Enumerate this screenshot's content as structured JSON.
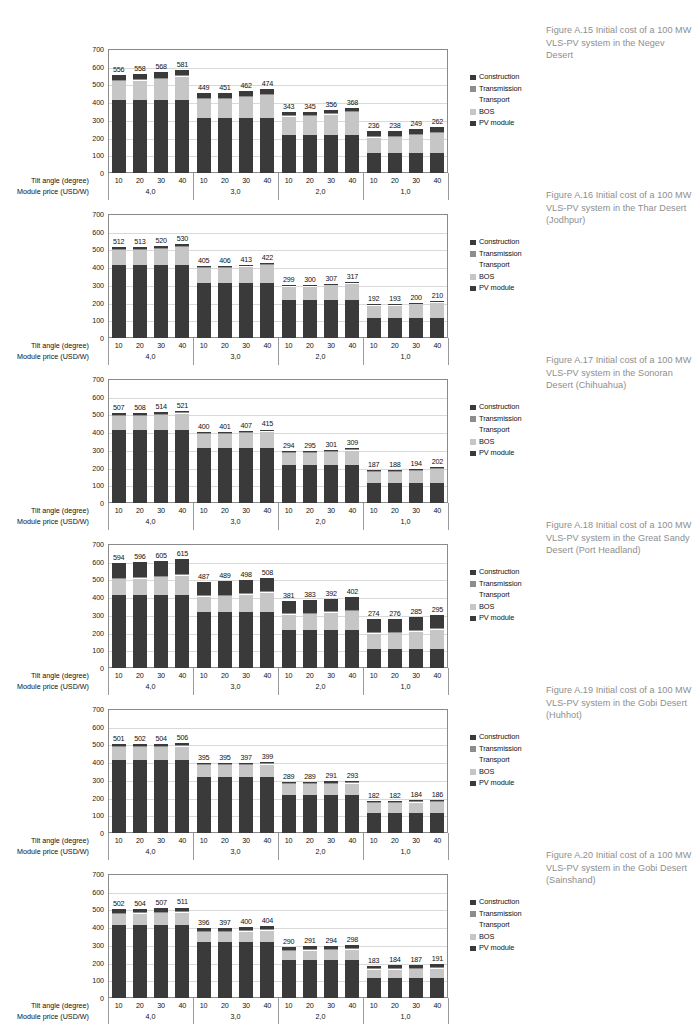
{
  "axis": {
    "y_ticks": [
      700,
      600,
      500,
      400,
      300,
      200,
      100,
      0
    ],
    "y_min": 0,
    "y_max": 700,
    "tilt_row_label": "Tilt angle (degree)",
    "price_row_label": "Module price (USD/W)",
    "tilt_angles": [
      "10",
      "20",
      "30",
      "40",
      "10",
      "20",
      "30",
      "40",
      "10",
      "20",
      "30",
      "40",
      "10",
      "20",
      "30",
      "40"
    ],
    "module_prices": [
      "4,0",
      "3,0",
      "2,0",
      "1,0"
    ]
  },
  "legend": {
    "items": [
      {
        "label": "Construction",
        "color": "#3a3a3a",
        "swatch": true
      },
      {
        "label": "Transmission",
        "color": "#8d8d8d",
        "swatch": true
      },
      {
        "label": "Transport",
        "color": "#ffffff",
        "swatch": false
      },
      {
        "label": "BOS",
        "color": "#c6c6c6",
        "swatch": true
      },
      {
        "label": "PV module",
        "color": "#3a3a3a",
        "swatch": true
      }
    ]
  },
  "colors": {
    "pv_module": "#3a3a3a",
    "bos": "#c6c6c6",
    "transport": "#fdfdfd",
    "transmission": "#8d8d8d",
    "construction": "#3a3a3a",
    "plot_border": "#8a8a8a",
    "gridline": "#d9d9d9",
    "caption_text": "#8e8e8e"
  },
  "chart_data": [
    {
      "type": "bar",
      "id": "fig-a15",
      "title": "Figure A.15 Initial cost of a 100 MW VLS-PV system in the Negev Desert",
      "caption": "Figure A.15 Initial cost of a 100 MW VLS-PV system in the Negev Desert",
      "xlabel": "Tilt angle (degree) / Module price (USD/W)",
      "ylabel": "",
      "ylim": [
        0,
        700
      ],
      "grid": true,
      "legend_position": "right",
      "stacked": true,
      "categories": [
        "10",
        "20",
        "30",
        "40",
        "10",
        "20",
        "30",
        "40",
        "10",
        "20",
        "30",
        "40",
        "10",
        "20",
        "30",
        "40"
      ],
      "groups": [
        "4,0",
        "3,0",
        "2,0",
        "1,0"
      ],
      "totals": [
        556,
        558,
        568,
        581,
        449,
        451,
        462,
        474,
        343,
        345,
        356,
        368,
        236,
        238,
        249,
        262
      ],
      "series": [
        {
          "name": "PV module",
          "values": [
            413,
            413,
            413,
            413,
            310,
            310,
            310,
            310,
            212,
            212,
            212,
            212,
            114,
            114,
            114,
            114
          ]
        },
        {
          "name": "BOS",
          "values": [
            107,
            109,
            119,
            132,
            107,
            109,
            120,
            132,
            107,
            109,
            120,
            132,
            88,
            90,
            101,
            114
          ]
        },
        {
          "name": "Transport",
          "values": [
            4,
            4,
            4,
            4,
            4,
            4,
            4,
            4,
            4,
            4,
            4,
            4,
            4,
            4,
            4,
            4
          ]
        },
        {
          "name": "Transmission",
          "values": [
            2,
            2,
            2,
            2,
            2,
            2,
            2,
            2,
            2,
            2,
            2,
            2,
            2,
            2,
            2,
            2
          ]
        },
        {
          "name": "Construction",
          "values": [
            30,
            30,
            30,
            30,
            26,
            26,
            26,
            26,
            18,
            18,
            18,
            18,
            28,
            28,
            28,
            28
          ]
        }
      ]
    },
    {
      "type": "bar",
      "id": "fig-a16",
      "title": "Figure A.16 Initial cost of a 100 MW VLS-PV system in the Thar Desert (Jodhpur)",
      "caption": "Figure A.16 Initial cost of a 100 MW VLS-PV system in the Thar Desert (Jodhpur)",
      "ylim": [
        0,
        700
      ],
      "grid": true,
      "legend_position": "right",
      "stacked": true,
      "categories": [
        "10",
        "20",
        "30",
        "40",
        "10",
        "20",
        "30",
        "40",
        "10",
        "20",
        "30",
        "40",
        "10",
        "20",
        "30",
        "40"
      ],
      "groups": [
        "4,0",
        "3,0",
        "2,0",
        "1,0"
      ],
      "totals": [
        512,
        513,
        520,
        530,
        405,
        406,
        413,
        422,
        299,
        300,
        307,
        317,
        192,
        193,
        200,
        210
      ],
      "series": [
        {
          "name": "PV module",
          "values": [
            411,
            411,
            411,
            411,
            313,
            313,
            313,
            313,
            212,
            212,
            212,
            212,
            113,
            113,
            113,
            113
          ]
        },
        {
          "name": "BOS",
          "values": [
            84,
            85,
            92,
            102,
            84,
            85,
            92,
            101,
            80,
            81,
            88,
            98,
            72,
            73,
            80,
            90
          ]
        },
        {
          "name": "Transport",
          "values": [
            5,
            5,
            5,
            5,
            3,
            3,
            3,
            3,
            3,
            3,
            3,
            3,
            3,
            3,
            3,
            3
          ]
        },
        {
          "name": "Transmission",
          "values": [
            2,
            2,
            2,
            2,
            2,
            2,
            2,
            2,
            2,
            2,
            2,
            2,
            2,
            2,
            2,
            2
          ]
        },
        {
          "name": "Construction",
          "values": [
            10,
            10,
            10,
            10,
            3,
            3,
            3,
            3,
            2,
            2,
            2,
            2,
            2,
            2,
            2,
            2
          ]
        }
      ]
    },
    {
      "type": "bar",
      "id": "fig-a17",
      "title": "Figure A.17 Initial cost of a 100 MW VLS-PV system in the Sonoran Desert (Chihuahua)",
      "caption": "Figure A.17 Initial cost of a 100 MW VLS-PV system in the Sonoran Desert (Chihuahua)",
      "ylim": [
        0,
        700
      ],
      "grid": true,
      "legend_position": "right",
      "stacked": true,
      "categories": [
        "10",
        "20",
        "30",
        "40",
        "10",
        "20",
        "30",
        "40",
        "10",
        "20",
        "30",
        "40",
        "10",
        "20",
        "30",
        "40"
      ],
      "groups": [
        "4,0",
        "3,0",
        "2,0",
        "1,0"
      ],
      "totals": [
        507,
        508,
        514,
        521,
        400,
        401,
        407,
        415,
        294,
        295,
        301,
        309,
        187,
        188,
        194,
        202
      ],
      "series": [
        {
          "name": "PV module",
          "values": [
            411,
            411,
            411,
            411,
            312,
            312,
            312,
            312,
            212,
            212,
            212,
            212,
            113,
            113,
            113,
            113
          ]
        },
        {
          "name": "BOS",
          "values": [
            81,
            82,
            88,
            95,
            78,
            79,
            85,
            93,
            72,
            73,
            79,
            87,
            64,
            65,
            71,
            79
          ]
        },
        {
          "name": "Transport",
          "values": [
            4,
            4,
            4,
            4,
            3,
            3,
            3,
            3,
            3,
            3,
            3,
            3,
            3,
            3,
            3,
            3
          ]
        },
        {
          "name": "Transmission",
          "values": [
            2,
            2,
            2,
            2,
            2,
            2,
            2,
            2,
            2,
            2,
            2,
            2,
            2,
            2,
            2,
            2
          ]
        },
        {
          "name": "Construction",
          "values": [
            9,
            9,
            9,
            9,
            5,
            5,
            5,
            5,
            5,
            5,
            5,
            5,
            5,
            5,
            5,
            5
          ]
        }
      ]
    },
    {
      "type": "bar",
      "id": "fig-a18",
      "title": "Figure A.18 Initial cost of a 100 MW VLS-PV system in the Great Sandy Desert (Port Headland)",
      "caption": "Figure A.18 Initial cost of a 100 MW VLS-PV system in the Great Sandy Desert (Port Headland)",
      "ylim": [
        0,
        700
      ],
      "grid": true,
      "legend_position": "right",
      "stacked": true,
      "categories": [
        "10",
        "20",
        "30",
        "40",
        "10",
        "20",
        "30",
        "40",
        "10",
        "20",
        "30",
        "40",
        "10",
        "20",
        "30",
        "40"
      ],
      "groups": [
        "4,0",
        "3,0",
        "2,0",
        "1,0"
      ],
      "totals": [
        594,
        596,
        605,
        615,
        487,
        489,
        498,
        508,
        381,
        383,
        392,
        402,
        274,
        276,
        285,
        295
      ],
      "series": [
        {
          "name": "PV module",
          "values": [
            415,
            415,
            415,
            415,
            317,
            317,
            317,
            317,
            215,
            215,
            215,
            215,
            109,
            109,
            109,
            109
          ]
        },
        {
          "name": "BOS",
          "values": [
            87,
            89,
            98,
            108,
            87,
            89,
            98,
            108,
            87,
            89,
            98,
            108,
            87,
            89,
            98,
            108
          ]
        },
        {
          "name": "Transport",
          "values": [
            4,
            4,
            4,
            4,
            4,
            4,
            4,
            4,
            4,
            4,
            4,
            4,
            4,
            4,
            4,
            4
          ]
        },
        {
          "name": "Transmission",
          "values": [
            3,
            3,
            3,
            3,
            3,
            3,
            3,
            3,
            3,
            3,
            3,
            3,
            3,
            3,
            3,
            3
          ]
        },
        {
          "name": "Construction",
          "values": [
            85,
            85,
            85,
            85,
            76,
            76,
            76,
            76,
            72,
            72,
            72,
            72,
            74,
            74,
            74,
            74
          ]
        }
      ]
    },
    {
      "type": "bar",
      "id": "fig-a19",
      "title": "Figure A.19 Initial cost of a 100 MW VLS-PV system in the Gobi Desert (Huhhot)",
      "caption": "Figure A.19 Initial cost of a 100 MW VLS-PV system in the Gobi Desert (Huhhot)",
      "ylim": [
        0,
        700
      ],
      "grid": true,
      "legend_position": "right",
      "stacked": true,
      "categories": [
        "10",
        "20",
        "30",
        "40",
        "10",
        "20",
        "30",
        "40",
        "10",
        "20",
        "30",
        "40",
        "10",
        "20",
        "30",
        "40"
      ],
      "groups": [
        "4,0",
        "3,0",
        "2,0",
        "1,0"
      ],
      "totals": [
        501,
        502,
        504,
        506,
        395,
        395,
        397,
        399,
        289,
        289,
        291,
        293,
        182,
        182,
        184,
        186
      ],
      "series": [
        {
          "name": "PV module",
          "values": [
            414,
            414,
            414,
            414,
            314,
            314,
            314,
            314,
            213,
            213,
            213,
            213,
            112,
            112,
            112,
            112
          ]
        },
        {
          "name": "BOS",
          "values": [
            71,
            72,
            74,
            76,
            70,
            70,
            72,
            74,
            65,
            65,
            67,
            69,
            60,
            60,
            62,
            64
          ]
        },
        {
          "name": "Transport",
          "values": [
            4,
            4,
            4,
            4,
            3,
            3,
            3,
            3,
            3,
            3,
            3,
            3,
            3,
            3,
            3,
            3
          ]
        },
        {
          "name": "Transmission",
          "values": [
            2,
            2,
            2,
            2,
            2,
            2,
            2,
            2,
            2,
            2,
            2,
            2,
            2,
            2,
            2,
            2
          ]
        },
        {
          "name": "Construction",
          "values": [
            10,
            10,
            10,
            10,
            6,
            6,
            6,
            6,
            6,
            6,
            6,
            6,
            5,
            5,
            5,
            5
          ]
        }
      ]
    },
    {
      "type": "bar",
      "id": "fig-a20",
      "title": "Figure A.20 Initial cost of a 100 MW VLS-PV system in the Gobi Desert (Sainshand)",
      "caption": "Figure A.20 Initial cost of a 100 MW VLS-PV system in the Gobi Desert (Sainshand)",
      "ylim": [
        0,
        700
      ],
      "grid": true,
      "legend_position": "right",
      "stacked": true,
      "categories": [
        "10",
        "20",
        "30",
        "40",
        "10",
        "20",
        "30",
        "40",
        "10",
        "20",
        "30",
        "40",
        "10",
        "20",
        "30",
        "40"
      ],
      "groups": [
        "4,0",
        "3,0",
        "2,0",
        "1,0"
      ],
      "totals": [
        502,
        504,
        507,
        511,
        396,
        397,
        400,
        404,
        290,
        291,
        294,
        298,
        183,
        184,
        187,
        191
      ],
      "series": [
        {
          "name": "PV module",
          "values": [
            414,
            414,
            414,
            414,
            314,
            314,
            314,
            314,
            213,
            213,
            213,
            213,
            113,
            113,
            113,
            113
          ]
        },
        {
          "name": "BOS",
          "values": [
            60,
            62,
            65,
            69,
            58,
            59,
            62,
            66,
            53,
            54,
            57,
            61,
            47,
            48,
            51,
            55
          ]
        },
        {
          "name": "Transport",
          "values": [
            5,
            5,
            5,
            5,
            4,
            4,
            4,
            4,
            4,
            4,
            4,
            4,
            4,
            4,
            4,
            4
          ]
        },
        {
          "name": "Transmission",
          "values": [
            3,
            3,
            3,
            3,
            3,
            3,
            3,
            3,
            3,
            3,
            3,
            3,
            3,
            3,
            3,
            3
          ]
        },
        {
          "name": "Construction",
          "values": [
            20,
            20,
            20,
            20,
            17,
            17,
            17,
            17,
            17,
            17,
            17,
            17,
            16,
            16,
            16,
            16
          ]
        }
      ]
    }
  ]
}
